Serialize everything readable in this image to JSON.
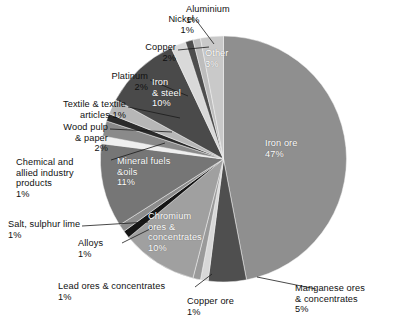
{
  "chart_data": {
    "type": "pie",
    "title": "",
    "subtitle": "",
    "xlabel": "",
    "ylabel": "",
    "legend_position": "none",
    "grid": false,
    "start_angle_deg": 0,
    "direction": "clockwise",
    "units": "percent",
    "categories": [
      "Iron ore",
      "Manganese ores & concentrates",
      "Copper ore",
      "Lead ores & concentrates",
      "Chromium ores & concentrates",
      "Alloys",
      "Salt, sulphur lime",
      "Mineral fuels &oils",
      "Chemical and allied industry products",
      "Wood pulp & paper",
      "Textile & textile articles",
      "Platinum",
      "Iron & steel",
      "Copper",
      "Nickel",
      "Aluminium",
      "Other"
    ],
    "values": [
      47,
      5,
      1,
      1,
      10,
      1,
      1,
      11,
      1,
      2,
      1,
      2,
      10,
      2,
      1,
      1,
      3
    ],
    "value_labels": [
      "47%",
      "5%",
      "1%",
      "1%",
      "10%",
      "1%",
      "1%",
      "11%",
      "1%",
      "2%",
      "1%",
      "2%",
      "10%",
      "2%",
      "1%",
      "1%",
      "3%"
    ],
    "colors": [
      "#8f8f8f",
      "#4f4f4f",
      "#d8d8d8",
      "#9a9a9a",
      "#a0a0a0",
      "#151515",
      "#8c8c8c",
      "#767676",
      "#efefef",
      "#8a8a8a",
      "#2b2b2b",
      "#b7b7b7",
      "#4a4a4a",
      "#d9d9d9",
      "#4d4d4d",
      "#bdbdbd",
      "#c9c9c9"
    ]
  },
  "slice_labels": {
    "iron_ore": "Iron ore\n47%",
    "manganese": "Manganese ores\n& concentrates\n5%",
    "copper_ore": "Copper ore\n1%",
    "lead_ores": "Lead ores & concentrates\n1%",
    "chromium": "Chromium\nores &\nconcentrates\n10%",
    "alloys": "Alloys\n1%",
    "salt": "Salt, sulphur lime\n1%",
    "mineral_fuels": "Mineral fuels\n&oils\n11%",
    "chemical": "Chemical and\nallied industry\nproducts\n1%",
    "wood_pulp": "Wood pulp\n& paper\n2%",
    "textile": "Textile & textile\narticles 1%",
    "platinum": "Platinum\n2%",
    "iron_steel": "Iron\n& steel\n10%",
    "copper": "Copper\n2%",
    "nickel": "Nickel\n1%",
    "aluminium": "Aluminium\n1%",
    "other": "Other\n3%"
  }
}
